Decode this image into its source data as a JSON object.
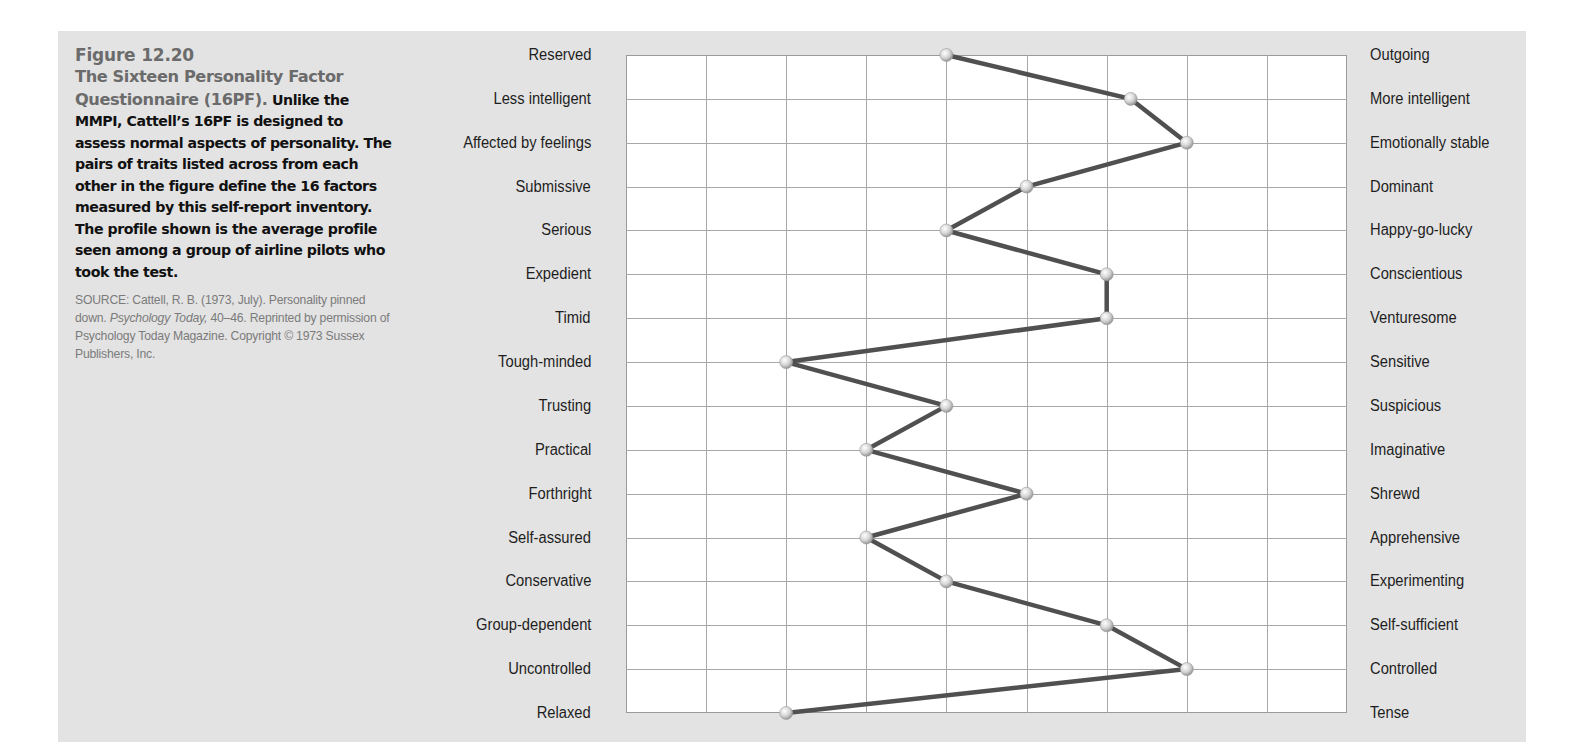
{
  "figure": {
    "number": "Figure 12.20",
    "title": "The Sixteen Personality Factor Questionnaire (16PF).",
    "body": " Unlike the MMPI, Cattell’s 16PF is designed to assess normal aspects of personality. The pairs of traits listed across from each other in the figure define the 16 factors measured by this self-report inventory. The profile shown is the average profile seen among a group of airline pilots who took the test.",
    "source_prefix": "SOURCE: Cattell, R. B. (1973, July). Personality pinned down. ",
    "source_journal": "Psychology Today,",
    "source_suffix": " 40–46. Reprinted by permission of Psychology Today Magazine. Copyright © 1973 Sussex Publishers, Inc."
  },
  "colors": {
    "panel_background": "#e3e3e3",
    "title_gray": "#6b6b6b",
    "line": "#505050",
    "grid": "#a8a8a8",
    "marker": "#d8d8d8"
  },
  "chart_data": {
    "type": "line",
    "orientation": "horizontal-profile",
    "title": "The Sixteen Personality Factor Questionnaire (16PF)",
    "xlabel": "",
    "ylabel": "",
    "xlim": [
      1,
      10
    ],
    "grid": true,
    "legend": null,
    "left_labels": [
      "Reserved",
      "Less intelligent",
      "Affected by feelings",
      "Submissive",
      "Serious",
      "Expedient",
      "Timid",
      "Tough-minded",
      "Trusting",
      "Practical",
      "Forthright",
      "Self-assured",
      "Conservative",
      "Group-dependent",
      "Uncontrolled",
      "Relaxed"
    ],
    "right_labels": [
      "Outgoing",
      "More  intelligent",
      "Emotionally stable",
      "Dominant",
      "Happy-go-lucky",
      "Conscientious",
      "Venturesome",
      "Sensitive",
      "Suspicious",
      "Imaginative",
      "Shrewd",
      "Apprehensive",
      "Experimenting",
      "Self-sufficient",
      "Controlled",
      "Tense"
    ],
    "series": [
      {
        "name": "Airline pilots (average profile)",
        "values": [
          5,
          7.3,
          8,
          6,
          5,
          7,
          7,
          3,
          5,
          4,
          6,
          4,
          5,
          7,
          8,
          3
        ]
      }
    ]
  }
}
